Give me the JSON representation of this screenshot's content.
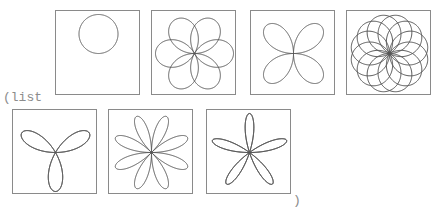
{
  "repl": {
    "open_text": "(list",
    "close_text": ")"
  },
  "chart_data": {
    "type": "polar-rose-gallery",
    "stroke_color": "#555555",
    "border_color": "#8a8a8a",
    "plots": [
      {
        "label": "circle",
        "k_num": 1,
        "k_den": 1,
        "petals": 1
      },
      {
        "label": "rose-6-wide",
        "k_num": 3,
        "k_den": 2,
        "petals": 6
      },
      {
        "label": "rose-4",
        "k_num": 2,
        "k_den": 1,
        "petals": 4
      },
      {
        "label": "rose-12-wide",
        "k_num": 6,
        "k_den": 5,
        "petals": 12
      },
      {
        "label": "rose-3",
        "k_num": 3,
        "k_den": 1,
        "petals": 3
      },
      {
        "label": "rose-8",
        "k_num": 4,
        "k_den": 1,
        "petals": 8
      },
      {
        "label": "rose-5",
        "k_num": 5,
        "k_den": 1,
        "petals": 5
      }
    ]
  }
}
